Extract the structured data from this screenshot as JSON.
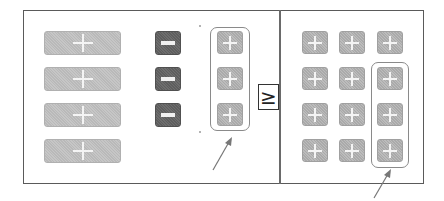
{
  "diagram": {
    "type": "comparison",
    "comparison_symbol": "≥",
    "left_panel": {
      "wide_plus_buttons": 4,
      "dark_minus_buttons": 3,
      "small_plus_buttons_highlighted": 3,
      "highlighted_column": "small plus buttons (3)"
    },
    "right_panel": {
      "grid_columns": 3,
      "grid_rows": 4,
      "small_plus_buttons": 12,
      "highlighted_column": "right column rows 2-4 (3)"
    },
    "colors": {
      "frame": "#5a5a5a",
      "wide_button": "#c0c0c0",
      "small_button": "#b2b2b2",
      "dark_button": "#666666",
      "glyph": "#f4f4f4",
      "highlight_outline": "#8a8a8a"
    },
    "icons": {
      "plus": "plus-icon",
      "minus": "minus-icon",
      "arrow": "arrow-icon"
    }
  }
}
